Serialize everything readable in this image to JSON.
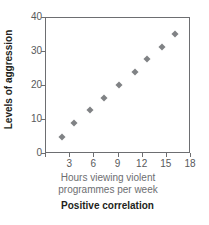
{
  "chart_data": {
    "type": "scatter",
    "title": "",
    "caption": "Positive correlation",
    "xlabel_lines": [
      "Hours viewing violent",
      "programmes per week"
    ],
    "xlabel": "Hours viewing violent programmes per week",
    "ylabel": "Levels of aggression",
    "xlim": [
      0,
      18
    ],
    "ylim": [
      0,
      40
    ],
    "xticks": [
      0,
      3,
      6,
      9,
      12,
      15,
      18
    ],
    "xtick_labels": [
      "0",
      "3",
      "6",
      "9",
      "12",
      "15",
      "18"
    ],
    "yticks": [
      0,
      10,
      20,
      30,
      40
    ],
    "ytick_labels": [
      "0",
      "10",
      "20",
      "30",
      "40"
    ],
    "grid": false,
    "legend": null,
    "marker_shape": "diamond",
    "marker_color": "#808285",
    "points": [
      {
        "x": 2.0,
        "y": 5.0
      },
      {
        "x": 3.5,
        "y": 9.0
      },
      {
        "x": 5.4,
        "y": 13.0
      },
      {
        "x": 7.2,
        "y": 16.5
      },
      {
        "x": 9.0,
        "y": 20.2
      },
      {
        "x": 11.0,
        "y": 24.0
      },
      {
        "x": 12.5,
        "y": 27.8
      },
      {
        "x": 14.4,
        "y": 31.6
      },
      {
        "x": 16.0,
        "y": 35.2
      }
    ]
  },
  "colors": {
    "marker": "#808285",
    "axis": "#6d6e71",
    "tick_text": "#58595b",
    "axis_title": "#231f20",
    "xlabel_text": "#6d6e71",
    "background": "#ffffff"
  }
}
